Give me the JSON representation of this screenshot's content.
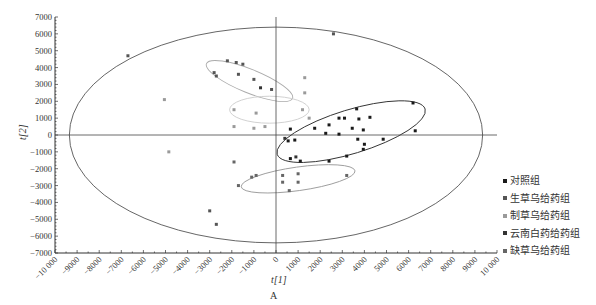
{
  "chart_data": {
    "type": "scatter",
    "title": "",
    "xlabel": "t[1]",
    "ylabel": "t[2]",
    "caption": "A",
    "xlim": [
      -10000,
      10000
    ],
    "ylim": [
      -7000,
      7000
    ],
    "x_ticks": [
      "-10 000",
      "-9000",
      "-8000",
      "-7000",
      "-6000",
      "-5000",
      "-4000",
      "-3000",
      "-2000",
      "-1000",
      "0",
      "1000",
      "2000",
      "3000",
      "4000",
      "5000",
      "6000",
      "7000",
      "8000",
      "9000",
      "10 000"
    ],
    "y_ticks": [
      "7000",
      "6000",
      "5000",
      "4000",
      "3000",
      "2000",
      "1000",
      "0",
      "-1000",
      "-2000",
      "-3000",
      "-4000",
      "-5000",
      "-6000",
      "-7000"
    ],
    "grid": false,
    "legend_position": "right-bottom",
    "hotelling_ellipse": {
      "cx": 0,
      "cy": 0,
      "rx": 9350,
      "ry": 6400
    },
    "series": [
      {
        "name": "对照组",
        "color": "#1a1a1a",
        "ellipse": {
          "cx": 3400,
          "cy": 200,
          "rx": 3500,
          "ry": 1300,
          "angle": -17
        },
        "points": [
          [
            6200,
            1900
          ],
          [
            6300,
            250
          ],
          [
            3650,
            1550
          ],
          [
            4250,
            1050
          ],
          [
            2850,
            1000
          ],
          [
            3100,
            1000
          ],
          [
            3750,
            950
          ],
          [
            2400,
            600
          ],
          [
            1750,
            400
          ],
          [
            3450,
            400
          ],
          [
            3950,
            300
          ],
          [
            2250,
            100
          ],
          [
            2850,
            50
          ],
          [
            650,
            350
          ],
          [
            4850,
            -250
          ],
          [
            3700,
            -250
          ],
          [
            850,
            -300
          ],
          [
            550,
            -350
          ],
          [
            4000,
            -550
          ],
          [
            3950,
            -850
          ],
          [
            3200,
            -1250
          ],
          [
            650,
            -1400
          ],
          [
            1100,
            -1550
          ],
          [
            2400,
            -1550
          ]
        ]
      },
      {
        "name": "生草乌给药组",
        "color": "#555555",
        "ellipse": {
          "cx": -1200,
          "cy": 3200,
          "rx": 2100,
          "ry": 700,
          "angle": 22
        },
        "points": [
          [
            -2200,
            4400
          ],
          [
            -1800,
            4300
          ],
          [
            -1500,
            4200
          ],
          [
            -2800,
            3700
          ],
          [
            -1700,
            3600
          ],
          [
            -1000,
            3300
          ],
          [
            -2700,
            3500
          ],
          [
            -200,
            2700
          ],
          [
            2600,
            6000
          ],
          [
            -6700,
            4700
          ],
          [
            -3000,
            -4500
          ],
          [
            -2700,
            -5300
          ]
        ]
      },
      {
        "name": "制草乌给药组",
        "color": "#9a9a9a",
        "ellipse": {
          "cx": -300,
          "cy": 1500,
          "rx": 1800,
          "ry": 800,
          "angle": 0
        },
        "points": [
          [
            -1900,
            1500
          ],
          [
            -900,
            1300
          ],
          [
            1500,
            1000
          ],
          [
            1200,
            1500
          ],
          [
            -1900,
            500
          ],
          [
            -1000,
            400
          ],
          [
            -500,
            500
          ],
          [
            -5050,
            2100
          ],
          [
            -4850,
            -1000
          ],
          [
            1300,
            2500
          ],
          [
            1300,
            3400
          ]
        ]
      },
      {
        "name": "云南白药给药组",
        "color": "#333333",
        "ellipse": {
          "cx": 1300,
          "cy": 5000,
          "rx": 2500,
          "ry": 700,
          "angle": 0
        },
        "points": [
          [
            -700,
            2800
          ],
          [
            400,
            -200
          ],
          [
            900,
            -1300
          ]
        ]
      },
      {
        "name": "缺草乌给药组",
        "color": "#666666",
        "ellipse": {
          "cx": 1000,
          "cy": -2600,
          "rx": 2600,
          "ry": 700,
          "angle": -8
        },
        "points": [
          [
            -1700,
            -3000
          ],
          [
            -1100,
            -2500
          ],
          [
            -900,
            -2400
          ],
          [
            300,
            -2400
          ],
          [
            1000,
            -2300
          ],
          [
            300,
            -2800
          ],
          [
            1000,
            -2800
          ],
          [
            600,
            -3300
          ],
          [
            3200,
            -2400
          ],
          [
            -1900,
            -1600
          ]
        ]
      }
    ]
  },
  "legend": {
    "items": [
      {
        "label": "对照组",
        "color": "#1a1a1a"
      },
      {
        "label": "生草乌给药组",
        "color": "#555555"
      },
      {
        "label": "制草乌给药组",
        "color": "#9a9a9a"
      },
      {
        "label": "云南白药给药组",
        "color": "#333333"
      },
      {
        "label": "缺草乌给药组",
        "color": "#666666"
      }
    ]
  },
  "axes": {
    "x_title": "t[1]",
    "y_title": "t[2]",
    "caption": "A"
  }
}
